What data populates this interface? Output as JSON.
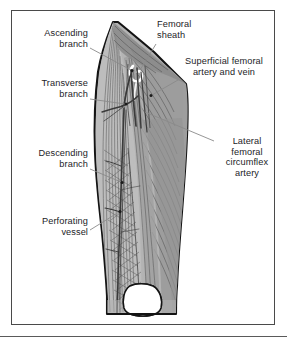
{
  "figure": {
    "frame": {
      "border_color": "#4a4a4a",
      "background": "#ffffff"
    },
    "palette": {
      "outline": "#141414",
      "muscle_light": "#c6c6c6",
      "muscle_mid": "#ababab",
      "muscle_dark": "#8e8e8e",
      "muscle_darker": "#7a7a7a",
      "fiber_line": "#555555",
      "vessel": "#3b3b3b",
      "bone_white": "#ffffff",
      "leader_line": "#8a8a8a",
      "marker_dot": "#1a1a1a",
      "text": "#23231f"
    },
    "labels": [
      {
        "name": "ascending-branch",
        "text": "Ascending\nbranch",
        "align": "right",
        "x": 18,
        "y": 28,
        "width": 70,
        "leader": {
          "x1": 90,
          "y1": 48,
          "x2": 131,
          "y2": 70
        },
        "marker": {
          "x": 132,
          "y": 70.5
        }
      },
      {
        "name": "transverse-branch",
        "text": "Transverse\nbranch",
        "align": "right",
        "x": 14,
        "y": 78,
        "width": 74,
        "leader": {
          "x1": 90,
          "y1": 99,
          "x2": 125,
          "y2": 104
        },
        "marker": {
          "x": 126,
          "y": 104
        }
      },
      {
        "name": "descending-branch",
        "text": "Descending\nbranch",
        "align": "right",
        "x": 12,
        "y": 148,
        "width": 76,
        "leader": {
          "x1": 90,
          "y1": 169,
          "x2": 121,
          "y2": 182
        },
        "marker": {
          "x": 122,
          "y": 182.5
        }
      },
      {
        "name": "perforating-vessel",
        "text": "Perforating\nvessel",
        "align": "right",
        "x": 14,
        "y": 216,
        "width": 74,
        "leader": {
          "x1": 90,
          "y1": 230,
          "x2": 119,
          "y2": 212
        },
        "marker": {
          "x": 120,
          "y": 211.5
        }
      },
      {
        "name": "femoral-sheath",
        "text": "Femoral\nsheath",
        "align": "left",
        "x": 157,
        "y": 19,
        "width": 66,
        "leader": {
          "x1": 156,
          "y1": 44,
          "x2": 140,
          "y2": 70
        },
        "marker": null
      },
      {
        "name": "superficial-femoral-artery-and-vein",
        "text": "Superficial femoral\nartery and vein",
        "align": "center",
        "x": 166,
        "y": 56,
        "width": 116,
        "leader": {
          "x1": 178,
          "y1": 80,
          "x2": 152,
          "y2": 95
        },
        "marker": {
          "x": 151,
          "y": 95.5
        }
      },
      {
        "name": "lateral-femoral-circumflex-artery",
        "text": "Lateral\nfemoral\ncircumflex\nartery",
        "align": "center",
        "x": 216,
        "y": 136,
        "width": 62,
        "leader": {
          "x1": 214,
          "y1": 141,
          "x2": 145,
          "y2": 112
        },
        "marker": null
      }
    ]
  }
}
